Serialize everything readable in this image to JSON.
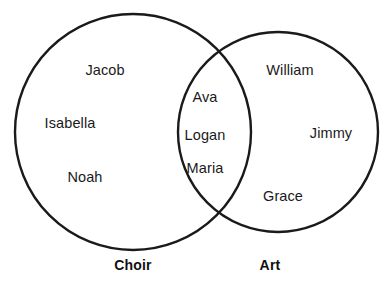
{
  "diagram": {
    "type": "venn",
    "title": "",
    "background_color": "#ffffff",
    "stroke_color": "#1a1a1a",
    "text_color": "#1a1a1a",
    "sets": [
      {
        "id": "choir",
        "label": "Choir",
        "label_x": 133,
        "label_y": 265,
        "circle": {
          "cx": 133,
          "cy": 132,
          "r": 118
        }
      },
      {
        "id": "art",
        "label": "Art",
        "label_x": 270,
        "label_y": 265,
        "circle": {
          "cx": 278,
          "cy": 132,
          "r": 100
        }
      }
    ],
    "regions": {
      "choir_only": {
        "name": "choir-only",
        "members": [
          {
            "text": "Jacob",
            "x": 105,
            "y": 70
          },
          {
            "text": "Isabella",
            "x": 70,
            "y": 123
          },
          {
            "text": "Noah",
            "x": 85,
            "y": 177
          }
        ]
      },
      "intersection": {
        "name": "choir-and-art",
        "members": [
          {
            "text": "Ava",
            "x": 205,
            "y": 97
          },
          {
            "text": "Logan",
            "x": 205,
            "y": 135
          },
          {
            "text": "Maria",
            "x": 205,
            "y": 168
          }
        ]
      },
      "art_only": {
        "name": "art-only",
        "members": [
          {
            "text": "William",
            "x": 290,
            "y": 70
          },
          {
            "text": "Jimmy",
            "x": 331,
            "y": 133
          },
          {
            "text": "Grace",
            "x": 283,
            "y": 196
          }
        ]
      }
    }
  }
}
